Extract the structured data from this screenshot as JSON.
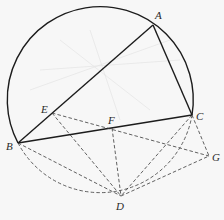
{
  "diagram": {
    "type": "geometry-circle-construction",
    "circle": {
      "cx": 101,
      "cy": 102,
      "r": 93
    },
    "points": {
      "A": {
        "label": "A",
        "x": 153,
        "y": 25,
        "lx": 155,
        "ly": 19
      },
      "B": {
        "label": "B",
        "x": 18,
        "y": 143,
        "lx": 6,
        "ly": 150
      },
      "C": {
        "label": "C",
        "x": 192,
        "y": 115,
        "lx": 196,
        "ly": 120
      },
      "D": {
        "label": "D",
        "x": 121,
        "y": 196,
        "lx": 116,
        "ly": 210
      },
      "E": {
        "label": "E",
        "x": 52,
        "y": 113,
        "lx": 41,
        "ly": 113
      },
      "F": {
        "label": "F",
        "x": 112,
        "y": 128,
        "lx": 108,
        "ly": 124
      },
      "G": {
        "label": "G",
        "x": 209,
        "y": 156,
        "lx": 212,
        "ly": 161
      }
    },
    "solid_segments": [
      [
        "A",
        "B"
      ],
      [
        "A",
        "C"
      ],
      [
        "B",
        "C"
      ]
    ],
    "dashed_segments": [
      [
        "E",
        "G"
      ],
      [
        "E",
        "D"
      ],
      [
        "F",
        "D"
      ],
      [
        "B",
        "D"
      ],
      [
        "C",
        "D"
      ],
      [
        "C",
        "G"
      ],
      [
        "D",
        "G"
      ]
    ],
    "arcs": {
      "upper": {
        "from": "B",
        "to": "C",
        "style": "solid",
        "via": "A"
      },
      "lower": {
        "from": "B",
        "to": "C",
        "style": "dashed",
        "via": "D"
      }
    },
    "colors": {
      "background": "#f7f7f7",
      "stroke": "#1c1c1c",
      "dashed": "#3a3a3a"
    }
  }
}
